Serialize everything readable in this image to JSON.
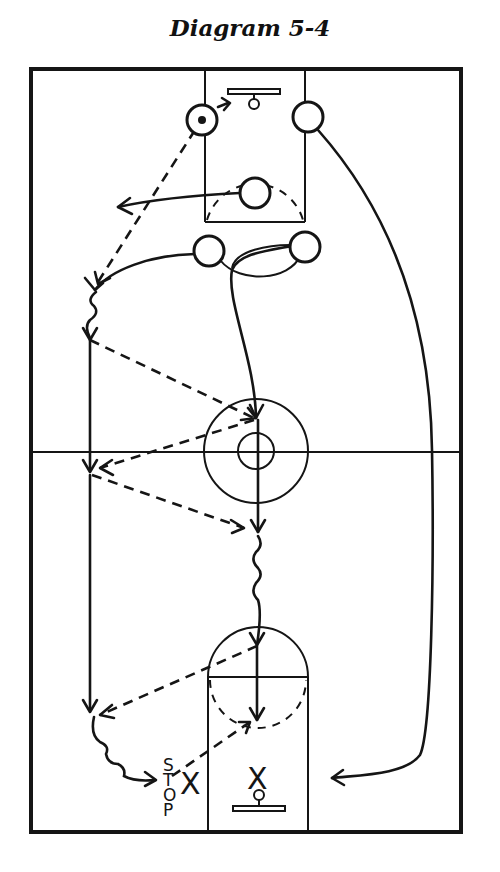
{
  "title": "Diagram 5-4",
  "diagram": {
    "type": "basketball-court-play",
    "court": {
      "outline": "full-court",
      "center_circle": true,
      "free_throw_lanes": 2
    },
    "players": [
      {
        "id": "ball-handler",
        "has_ball": true,
        "position": "top-left lane"
      },
      {
        "id": "top-right-lane",
        "has_ball": false
      },
      {
        "id": "free-throw-circle",
        "has_ball": false
      },
      {
        "id": "left-elbow",
        "has_ball": false
      },
      {
        "id": "right-elbow",
        "has_ball": false
      }
    ],
    "labels": {
      "stop": [
        "S",
        "T",
        "O",
        "P"
      ],
      "x_left": "X",
      "x_basket": "X"
    }
  }
}
